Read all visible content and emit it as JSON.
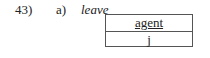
{
  "example": {
    "number": "43)",
    "label": "a)",
    "word": "leave"
  },
  "frame": {
    "rows": [
      {
        "text": "agent"
      },
      {
        "text": "j"
      }
    ]
  }
}
